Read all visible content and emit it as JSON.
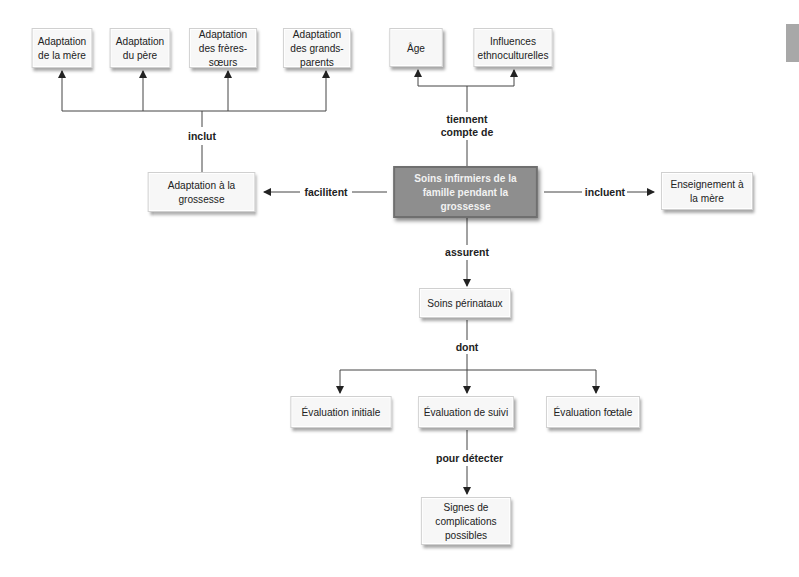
{
  "diagram": {
    "central": {
      "label": "Soins infirmiers de la famille pendant la grossesse"
    },
    "nodes": {
      "adaptation_mere": "Adaptation de la mère",
      "adaptation_pere": "Adaptation du père",
      "adaptation_freres": "Adaptation des frères-sœurs",
      "adaptation_grands_parents": "Adaptation des grands-parents",
      "age": "Âge",
      "influences": "Influences ethnoculturelles",
      "adaptation_grossesse": "Adaptation à la grossesse",
      "enseignement": "Enseignement à la mère",
      "soins_perinataux": "Soins périnataux",
      "evaluation_initiale": "Évaluation initiale",
      "evaluation_suivi": "Évaluation de suivi",
      "evaluation_foetale": "Évaluation fœtale",
      "signes": "Signes de complications possibles"
    },
    "links": {
      "inclut": "inclut",
      "tiennent_compte": "tiennent compte de",
      "facilitent": "facilitent",
      "incluent": "incluent",
      "assurent": "assurent",
      "dont": "dont",
      "pour_detecter": "pour détecter"
    },
    "colors": {
      "central_fill": "#8e8e8e",
      "box_fill": "#f7f7f7",
      "line": "#333333"
    }
  }
}
